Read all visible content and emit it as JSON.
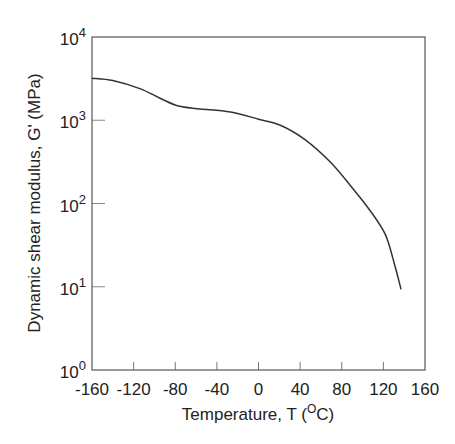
{
  "chart_data": {
    "type": "line",
    "title": "",
    "xlabel": "Temperature,  T  (°C)",
    "xlabel_parts": {
      "main": "Temperature,  T  (",
      "sup": "O",
      "unit": "C)"
    },
    "ylabel": "Dynamic shear modulus, G'  (MPa)",
    "xlim": [
      -160,
      160
    ],
    "ylim": [
      1,
      10000
    ],
    "yscale": "log",
    "grid": false,
    "legend": null,
    "x_ticks": [
      -160,
      -120,
      -80,
      -40,
      0,
      40,
      80,
      120,
      160
    ],
    "x_tick_labels": [
      "-160",
      "-120",
      "-80",
      "-40",
      "0",
      "40",
      "80",
      "120",
      "160"
    ],
    "y_ticks": [
      1,
      10,
      100,
      1000,
      10000
    ],
    "y_tick_labels": [
      {
        "base": "10",
        "exp": "0"
      },
      {
        "base": "10",
        "exp": "1"
      },
      {
        "base": "10",
        "exp": "2"
      },
      {
        "base": "10",
        "exp": "3"
      },
      {
        "base": "10",
        "exp": "4"
      }
    ],
    "series": [
      {
        "name": "G'",
        "color": "#333333",
        "x": [
          -160,
          -140,
          -114,
          -95,
          -77,
          -56,
          -27,
          0,
          21,
          45,
          69,
          88,
          107,
          122,
          131,
          137
        ],
        "y": [
          3200,
          3000,
          2400,
          1850,
          1480,
          1370,
          1260,
          1030,
          870,
          580,
          315,
          166,
          83,
          42,
          18,
          9.3
        ]
      }
    ]
  }
}
